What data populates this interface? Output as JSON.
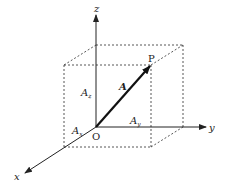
{
  "diagram": {
    "title": "",
    "axes": {
      "x": {
        "label": "x"
      },
      "y": {
        "label": "y"
      },
      "z": {
        "label": "z"
      }
    },
    "points": {
      "origin": {
        "label": "O"
      },
      "tip": {
        "label": "P"
      }
    },
    "vector": {
      "label": "A"
    },
    "components": {
      "x": {
        "label": "A",
        "sub": "x"
      },
      "y": {
        "label": "A",
        "sub": "y"
      },
      "z": {
        "label": "A",
        "sub": "z"
      }
    },
    "colors": {
      "line": "#222222",
      "dashed": "#444444",
      "background": "#ffffff"
    }
  }
}
